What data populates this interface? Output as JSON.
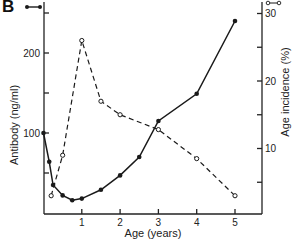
{
  "panel_label": "B",
  "chart_data": {
    "type": "line",
    "title": "",
    "xlabel": "Age (years)",
    "ylabel": "Antibody (ng/ml)",
    "y2label": "Age incidence (%)",
    "xlim": [
      0,
      5.6
    ],
    "ylim": [
      0,
      265
    ],
    "y2lim": [
      0,
      31
    ],
    "x_ticks": [
      1,
      2,
      3,
      4,
      5
    ],
    "y_ticks": [
      50,
      100,
      150,
      200,
      250
    ],
    "y_tick_labels": {
      "100": "100",
      "200": "200"
    },
    "y2_ticks": [
      5,
      10,
      15,
      20,
      25,
      30
    ],
    "y2_tick_labels": {
      "10": "10",
      "20": "20",
      "30": "30"
    },
    "grid": false,
    "legend": [
      {
        "name": "Antibody",
        "marker": "filled-circle",
        "style": "solid",
        "position": "top-left"
      },
      {
        "name": "Age incidence",
        "marker": "open-circle",
        "style": "dashed",
        "position": "top-right"
      }
    ],
    "series": [
      {
        "name": "Antibody (ng/ml)",
        "axis": "left",
        "style": "solid",
        "marker": "filled",
        "x": [
          0,
          0.15,
          0.25,
          0.5,
          0.75,
          1,
          1.5,
          2,
          2.5,
          3,
          4,
          5
        ],
        "values": [
          100,
          64,
          35,
          22,
          16,
          18,
          29,
          47,
          70,
          115,
          149,
          240
        ]
      },
      {
        "name": "Age incidence (%)",
        "axis": "right",
        "style": "dashed",
        "marker": "open",
        "x": [
          0.2,
          0.5,
          1,
          1.5,
          2,
          3,
          4,
          5
        ],
        "values": [
          3,
          9,
          26,
          17,
          15,
          12.8,
          8.5,
          3
        ]
      }
    ]
  }
}
